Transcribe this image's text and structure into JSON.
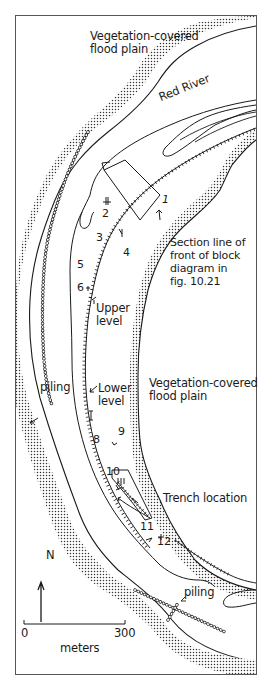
{
  "map": {
    "labels": {
      "floodplain_top": "Vegetation-covered\nflood plain",
      "river": "Red River",
      "section_line": "Section line of\nfront of block\ndiagram in\nfig. 10.21",
      "upper_level": "Upper\nlevel",
      "lower_level": "Lower\nlevel",
      "floodplain_mid": "Vegetation-covered\nflood plain",
      "piling_west": "piling",
      "piling_south": "piling",
      "trench": "Trench location",
      "north": "N",
      "scale_zero": "0",
      "scale_max": "300",
      "scale_units": "meters"
    },
    "stations": [
      "1",
      "2",
      "3",
      "4",
      "5",
      "6",
      "7",
      "8",
      "9",
      "10",
      "11",
      "12"
    ],
    "colors": {
      "ink": "#1a1a1a",
      "stipple": "#333333",
      "frame": "#555555",
      "background": "#ffffff"
    },
    "scale_bar": {
      "min": 0,
      "max": 300,
      "units": "meters"
    }
  }
}
